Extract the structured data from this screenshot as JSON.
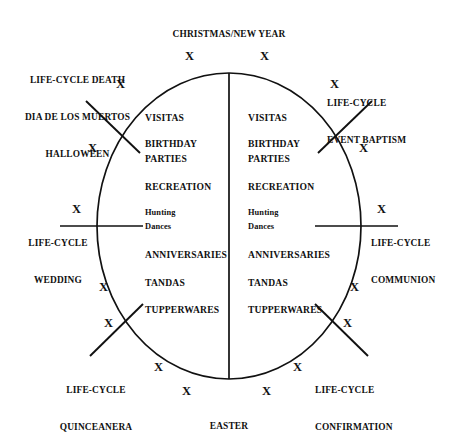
{
  "figure": {
    "type": "cycle-diagram",
    "shape": {
      "ellipse": {
        "cx": 229,
        "cy": 226,
        "rx": 132,
        "ry": 153
      },
      "divider": {
        "x": 229,
        "y_top": 73,
        "y_bottom": 379
      },
      "grid": false
    },
    "anchors": {
      "top": "CHRISTMAS/NEW YEAR",
      "bottom": "EASTER"
    },
    "life_cycle_events": [
      {
        "id": "death",
        "position": "upper-left",
        "lines": [
          "LIFE-CYCLE DEATH",
          "DIA DE LOS MUERTOS",
          "HALLOWEEN"
        ],
        "align": "center"
      },
      {
        "id": "baptism",
        "position": "upper-right",
        "lines": [
          "LIFE-CYCLE",
          "EVENT BAPTISM"
        ],
        "align": "left"
      },
      {
        "id": "wedding",
        "position": "left",
        "lines": [
          "LIFE-CYCLE",
          "WEDDING"
        ],
        "align": "center"
      },
      {
        "id": "communion",
        "position": "right",
        "lines": [
          "LIFE-CYCLE",
          "COMMUNION"
        ],
        "align": "left"
      },
      {
        "id": "quinceanera",
        "position": "lower-left",
        "lines": [
          "LIFE-CYCLE",
          "QUINCEANERA"
        ],
        "align": "center"
      },
      {
        "id": "confirmation",
        "position": "lower-right",
        "lines": [
          "LIFE-CYCLE",
          "CONFIRMATION"
        ],
        "align": "left"
      }
    ],
    "left_column": {
      "name": "left-half-activities",
      "items": [
        {
          "text": "VISITAS",
          "style": "caps"
        },
        {
          "text": "BIRTHDAY",
          "style": "caps"
        },
        {
          "text": "PARTIES",
          "style": "caps"
        },
        {
          "text": "RECREATION",
          "style": "caps"
        },
        {
          "text": "Hunting",
          "style": "mixed"
        },
        {
          "text": "Dances",
          "style": "mixed"
        },
        {
          "text": "ANNIVERSARIES",
          "style": "caps"
        },
        {
          "text": "TANDAS",
          "style": "caps"
        },
        {
          "text": "TUPPERWARES",
          "style": "caps"
        }
      ]
    },
    "right_column": {
      "name": "right-half-activities",
      "items": [
        {
          "text": "VISITAS",
          "style": "caps"
        },
        {
          "text": "BIRTHDAY",
          "style": "caps"
        },
        {
          "text": "PARTIES",
          "style": "caps"
        },
        {
          "text": "RECREATION",
          "style": "caps"
        },
        {
          "text": "Hunting",
          "style": "mixed"
        },
        {
          "text": "Dances",
          "style": "mixed"
        },
        {
          "text": "ANNIVERSARIES",
          "style": "caps"
        },
        {
          "text": "TANDAS",
          "style": "caps"
        },
        {
          "text": "TUPPERWARES",
          "style": "caps"
        }
      ]
    },
    "x_markers": {
      "glyph": "X",
      "count": 12,
      "note": "Twelve X marks arranged around the ellipse, one per month of the annual cycle."
    },
    "colors": {
      "ink": "#111111",
      "background": "#ffffff"
    }
  }
}
